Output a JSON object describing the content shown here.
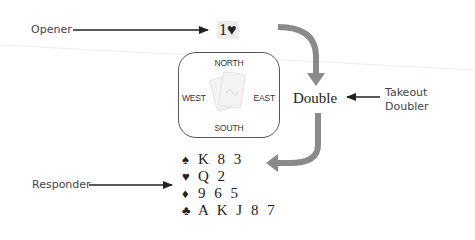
{
  "labels": {
    "opener": "Opener",
    "takeout_doubler_line1": "Takeout",
    "takeout_doubler_line2": "Doubler",
    "responder": "Responder"
  },
  "bids": {
    "opening": "1♥",
    "overcall": "Double"
  },
  "table": {
    "north": "NORTH",
    "south": "SOUTH",
    "east": "EAST",
    "west": "WEST",
    "center_icon": "playing-cards-icon"
  },
  "responder_hand": {
    "spades": {
      "symbol": "♠",
      "cards": "K 8 3"
    },
    "hearts": {
      "symbol": "♥",
      "cards": "Q 2"
    },
    "diamonds": {
      "symbol": "♦",
      "cards": "9 6 5"
    },
    "clubs": {
      "symbol": "♣",
      "cards": "A K J 8 7"
    }
  },
  "colors": {
    "flow_arrow": "#8a8a8a",
    "pointer_arrow": "#222222",
    "text": "#333333"
  }
}
